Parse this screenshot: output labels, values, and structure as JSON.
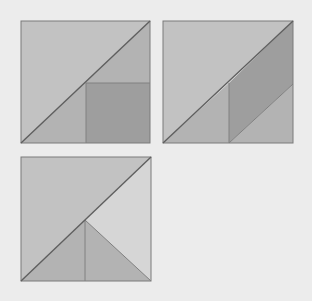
{
  "diagram": {
    "colors": {
      "background": "#ececec",
      "light": "#c2c2c2",
      "medium": "#b3b3b3",
      "dark": "#9e9e9e",
      "lightest": "#d6d6d6",
      "edge": "#7a7a7a",
      "diagonal": "#5f5f5f"
    },
    "figures": [
      {
        "name": "figure-1",
        "description": "Square split by diagonal; lower-right triangle contains an inscribed square whose corner touches the diagonal",
        "regions": [
          {
            "name": "upper-left-triangle",
            "shade": "light"
          },
          {
            "name": "lower-left-triangle-part",
            "shade": "medium"
          },
          {
            "name": "inscribed-square",
            "shade": "dark"
          },
          {
            "name": "upper-right-small-triangle",
            "shade": "medium"
          }
        ]
      },
      {
        "name": "figure-2",
        "description": "Square split by diagonal; lower-right triangle split into a triangle, a parallelogram and a triangle",
        "regions": [
          {
            "name": "upper-left-triangle",
            "shade": "light"
          },
          {
            "name": "lower-left-triangle",
            "shade": "medium"
          },
          {
            "name": "parallelogram",
            "shade": "dark"
          },
          {
            "name": "lower-right-triangle",
            "shade": "medium"
          }
        ]
      },
      {
        "name": "figure-3",
        "description": "Square split by diagonal; lower-right triangle split into two small triangles and a lighter triangle",
        "regions": [
          {
            "name": "upper-left-triangle",
            "shade": "light"
          },
          {
            "name": "bottom-left-small-triangle",
            "shade": "medium"
          },
          {
            "name": "bottom-right-small-triangle",
            "shade": "medium"
          },
          {
            "name": "right-triangle",
            "shade": "lightest"
          }
        ]
      }
    ]
  }
}
